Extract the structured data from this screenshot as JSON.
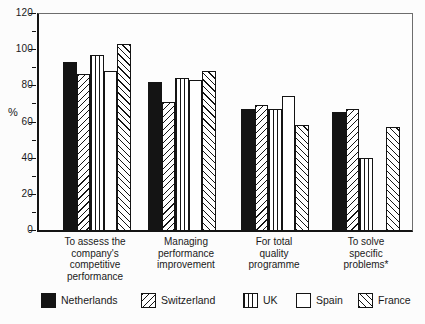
{
  "chart_data": {
    "type": "bar",
    "title": "",
    "ylabel": "%",
    "ylim": [
      0,
      120
    ],
    "yticks": [
      0,
      20,
      40,
      60,
      80,
      100,
      120
    ],
    "yminorticks": [
      10,
      30,
      50,
      70,
      90,
      110
    ],
    "grid": false,
    "legend_position": "bottom",
    "categories": [
      [
        "To assess the",
        "company's",
        "competitive",
        "performance"
      ],
      [
        "Managing",
        "performance",
        "improvement"
      ],
      [
        "For total",
        "quality",
        "programme"
      ],
      [
        "To solve",
        "specific",
        "problems*"
      ]
    ],
    "series": [
      {
        "name": "Netherlands",
        "pattern": "solid-black",
        "values": [
          93,
          82,
          67,
          65
        ]
      },
      {
        "name": "Switzerland",
        "pattern": "diagonal-forward",
        "values": [
          86,
          71,
          69,
          67
        ]
      },
      {
        "name": "UK",
        "pattern": "vertical-lines",
        "values": [
          97,
          84,
          67,
          40
        ]
      },
      {
        "name": "Spain",
        "pattern": "white",
        "values": [
          88,
          83,
          74,
          null
        ]
      },
      {
        "name": "France",
        "pattern": "diagonal-backward",
        "values": [
          103,
          88,
          58,
          57
        ]
      }
    ],
    "colors": {
      "bar_fill_black": "#141414",
      "bar_fill_white": "#ffffff",
      "outline": "#141414",
      "frame": "#6d6d6d",
      "background": "#fcfcfc"
    }
  }
}
